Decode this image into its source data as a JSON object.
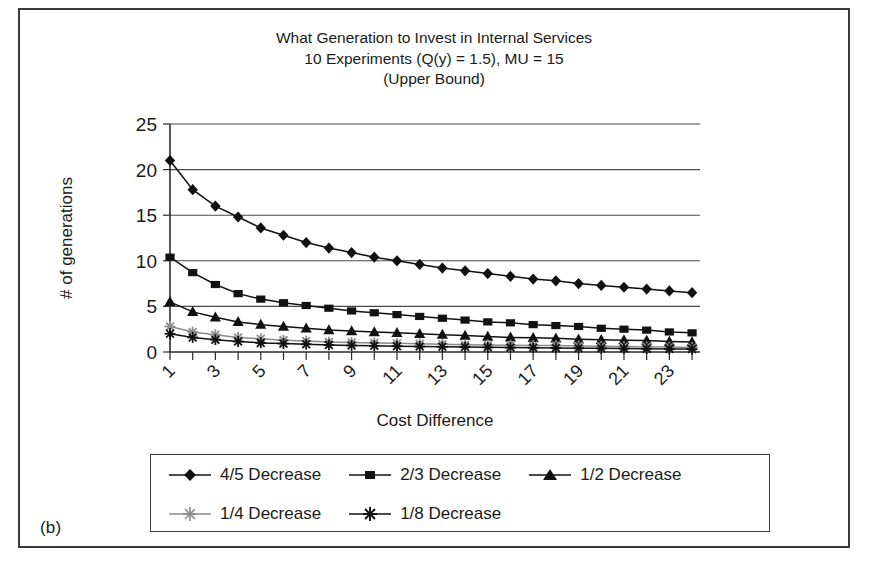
{
  "panel": {
    "label": "(b)"
  },
  "chart_data": {
    "type": "line",
    "title_lines": [
      "What Generation to Invest in Internal Services",
      "10 Experiments (Q(y) = 1.5), MU = 15",
      "(Upper Bound)"
    ],
    "title": "What Generation to Invest in Internal Services 10 Experiments (Q(y) = 1.5), MU = 15 (Upper Bound)",
    "xlabel": "Cost Difference",
    "ylabel": "# of generations",
    "ylim": [
      0,
      25
    ],
    "yticks": [
      0,
      5,
      10,
      15,
      20,
      25
    ],
    "grid": "horizontal",
    "legend_position": "bottom",
    "x": [
      1,
      2,
      3,
      4,
      5,
      6,
      7,
      8,
      9,
      10,
      11,
      12,
      13,
      14,
      15,
      16,
      17,
      18,
      19,
      20,
      21,
      22,
      23,
      24
    ],
    "xtick_labels": [
      "1",
      "3",
      "5",
      "7",
      "9",
      "11",
      "13",
      "15",
      "17",
      "19",
      "21",
      "23"
    ],
    "xtick_rotation": 45,
    "series": [
      {
        "name": "4/5 Decrease",
        "marker": "diamond",
        "color": "#111111",
        "values": [
          21.0,
          17.8,
          16.0,
          14.8,
          13.6,
          12.8,
          12.0,
          11.4,
          10.9,
          10.4,
          10.0,
          9.6,
          9.2,
          8.9,
          8.6,
          8.3,
          8.0,
          7.8,
          7.5,
          7.3,
          7.1,
          6.9,
          6.7,
          6.5
        ]
      },
      {
        "name": "2/3 Decrease",
        "marker": "square",
        "color": "#111111",
        "values": [
          10.4,
          8.7,
          7.4,
          6.4,
          5.8,
          5.4,
          5.1,
          4.8,
          4.5,
          4.3,
          4.1,
          3.9,
          3.7,
          3.5,
          3.3,
          3.2,
          3.0,
          2.9,
          2.8,
          2.6,
          2.5,
          2.4,
          2.2,
          2.1
        ]
      },
      {
        "name": "1/2 Decrease",
        "marker": "triangle",
        "color": "#111111",
        "values": [
          5.5,
          4.4,
          3.8,
          3.3,
          3.0,
          2.8,
          2.6,
          2.4,
          2.3,
          2.2,
          2.1,
          2.0,
          1.9,
          1.8,
          1.7,
          1.6,
          1.55,
          1.5,
          1.4,
          1.35,
          1.3,
          1.25,
          1.15,
          1.1
        ]
      },
      {
        "name": "1/4 Decrease",
        "marker": "asterisk",
        "color": "#8c8c8c",
        "values": [
          2.8,
          2.2,
          1.9,
          1.6,
          1.45,
          1.3,
          1.2,
          1.1,
          1.05,
          1.0,
          0.95,
          0.9,
          0.85,
          0.8,
          0.78,
          0.75,
          0.72,
          0.7,
          0.66,
          0.63,
          0.6,
          0.57,
          0.54,
          0.5
        ]
      },
      {
        "name": "1/8 Decrease",
        "marker": "asterisk",
        "color": "#111111",
        "values": [
          2.0,
          1.6,
          1.35,
          1.15,
          1.0,
          0.92,
          0.85,
          0.78,
          0.72,
          0.68,
          0.64,
          0.6,
          0.57,
          0.54,
          0.51,
          0.49,
          0.46,
          0.44,
          0.42,
          0.4,
          0.38,
          0.36,
          0.34,
          0.32
        ]
      }
    ]
  }
}
